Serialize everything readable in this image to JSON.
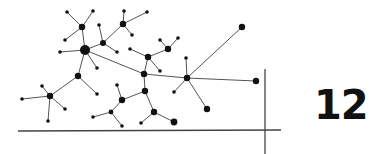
{
  "page": {
    "number": "12"
  },
  "diagram": {
    "type": "network",
    "line_color": "#555555",
    "node_color": "#111111",
    "nodes": [
      {
        "id": "hub",
        "x": 85,
        "y": 50,
        "r": 5
      },
      {
        "id": "a",
        "x": 82,
        "y": 27,
        "r": 3.2
      },
      {
        "id": "a1",
        "x": 67,
        "y": 12,
        "r": 1.8
      },
      {
        "id": "a2",
        "x": 93,
        "y": 11,
        "r": 1.8
      },
      {
        "id": "a3",
        "x": 65,
        "y": 40,
        "r": 1.8
      },
      {
        "id": "h1",
        "x": 60,
        "y": 52,
        "r": 1.8
      },
      {
        "id": "h2",
        "x": 97,
        "y": 68,
        "r": 1.8
      },
      {
        "id": "b",
        "x": 103,
        "y": 43,
        "r": 3
      },
      {
        "id": "b1",
        "x": 99,
        "y": 25,
        "r": 1.8
      },
      {
        "id": "b2",
        "x": 117,
        "y": 52,
        "r": 1.8
      },
      {
        "id": "c",
        "x": 123,
        "y": 24,
        "r": 3.2
      },
      {
        "id": "c1",
        "x": 124,
        "y": 11,
        "r": 1.8
      },
      {
        "id": "c2",
        "x": 147,
        "y": 12,
        "r": 1.8
      },
      {
        "id": "c3",
        "x": 132,
        "y": 35,
        "r": 1.8
      },
      {
        "id": "d",
        "x": 78,
        "y": 76,
        "r": 3.2
      },
      {
        "id": "d1",
        "x": 97,
        "y": 94,
        "r": 1.8
      },
      {
        "id": "e",
        "x": 50,
        "y": 96,
        "r": 3.2
      },
      {
        "id": "e1",
        "x": 22,
        "y": 99,
        "r": 1.8
      },
      {
        "id": "e2",
        "x": 42,
        "y": 86,
        "r": 1.8
      },
      {
        "id": "e3",
        "x": 65,
        "y": 109,
        "r": 1.8
      },
      {
        "id": "e4",
        "x": 48,
        "y": 121,
        "r": 1.8
      },
      {
        "id": "f",
        "x": 144,
        "y": 74,
        "r": 3.2
      },
      {
        "id": "g",
        "x": 148,
        "y": 57,
        "r": 3.2
      },
      {
        "id": "g1",
        "x": 130,
        "y": 49,
        "r": 1.8
      },
      {
        "id": "g2",
        "x": 160,
        "y": 71,
        "r": 1.8
      },
      {
        "id": "k",
        "x": 168,
        "y": 49,
        "r": 3.2
      },
      {
        "id": "k1",
        "x": 160,
        "y": 40,
        "r": 1.8
      },
      {
        "id": "k2",
        "x": 178,
        "y": 38,
        "r": 1.8
      },
      {
        "id": "m",
        "x": 145,
        "y": 91,
        "r": 3.2
      },
      {
        "id": "n",
        "x": 122,
        "y": 100,
        "r": 3.2
      },
      {
        "id": "n1",
        "x": 117,
        "y": 85,
        "r": 1.8
      },
      {
        "id": "o",
        "x": 111,
        "y": 112,
        "r": 2.4
      },
      {
        "id": "o1",
        "x": 93,
        "y": 117,
        "r": 1.8
      },
      {
        "id": "o2",
        "x": 122,
        "y": 126,
        "r": 1.8
      },
      {
        "id": "p",
        "x": 154,
        "y": 112,
        "r": 3.2
      },
      {
        "id": "p1",
        "x": 141,
        "y": 123,
        "r": 1.8
      },
      {
        "id": "p2",
        "x": 174,
        "y": 122,
        "r": 3.4
      },
      {
        "id": "q",
        "x": 187,
        "y": 78,
        "r": 3.2
      },
      {
        "id": "q1",
        "x": 242,
        "y": 27,
        "r": 3.2
      },
      {
        "id": "q2",
        "x": 256,
        "y": 81,
        "r": 3.2
      },
      {
        "id": "q3",
        "x": 186,
        "y": 58,
        "r": 1.8
      },
      {
        "id": "q4",
        "x": 174,
        "y": 92,
        "r": 1.8
      },
      {
        "id": "q5",
        "x": 207,
        "y": 109,
        "r": 3.2
      }
    ],
    "edges": [
      [
        "hub",
        "a"
      ],
      [
        "a",
        "a1"
      ],
      [
        "a",
        "a2"
      ],
      [
        "a",
        "a3"
      ],
      [
        "hub",
        "h1"
      ],
      [
        "hub",
        "h2"
      ],
      [
        "hub",
        "b"
      ],
      [
        "b",
        "b1"
      ],
      [
        "b",
        "b2"
      ],
      [
        "b",
        "c"
      ],
      [
        "c",
        "c1"
      ],
      [
        "c",
        "c2"
      ],
      [
        "c",
        "c3"
      ],
      [
        "hub",
        "d"
      ],
      [
        "d",
        "d1"
      ],
      [
        "d",
        "e"
      ],
      [
        "e",
        "e1"
      ],
      [
        "e",
        "e2"
      ],
      [
        "e",
        "e3"
      ],
      [
        "e",
        "e4"
      ],
      [
        "hub",
        "f"
      ],
      [
        "f",
        "g"
      ],
      [
        "g",
        "g1"
      ],
      [
        "g",
        "g2"
      ],
      [
        "g",
        "k"
      ],
      [
        "k",
        "k1"
      ],
      [
        "k",
        "k2"
      ],
      [
        "f",
        "m"
      ],
      [
        "m",
        "n"
      ],
      [
        "n",
        "n1"
      ],
      [
        "n",
        "o"
      ],
      [
        "o",
        "o1"
      ],
      [
        "o",
        "o2"
      ],
      [
        "m",
        "p"
      ],
      [
        "p",
        "p1"
      ],
      [
        "p",
        "p2"
      ],
      [
        "f",
        "q"
      ],
      [
        "q",
        "q1"
      ],
      [
        "q",
        "q2"
      ],
      [
        "q",
        "q3"
      ],
      [
        "q",
        "q4"
      ],
      [
        "q",
        "q5"
      ]
    ],
    "axes": {
      "horizontal": {
        "x1": 18,
        "y1": 131,
        "x2": 281,
        "y2": 130
      },
      "vertical": {
        "x1": 265,
        "y1": 69,
        "x2": 265,
        "y2": 154
      }
    }
  }
}
